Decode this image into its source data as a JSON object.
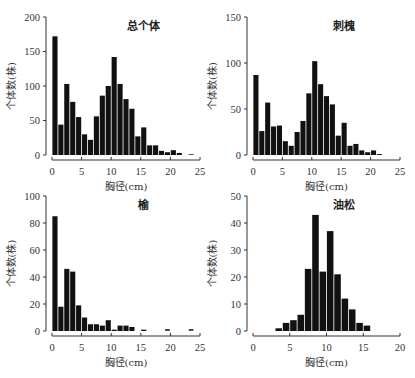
{
  "chart_data": [
    {
      "type": "bar",
      "title": "总个体",
      "xlabel": "胸径(cm)",
      "ylabel": "个体数(株)",
      "xlim": [
        0,
        25
      ],
      "ylim": [
        0,
        200
      ],
      "xticks": [
        0,
        5,
        10,
        15,
        20,
        25
      ],
      "yticks": [
        0,
        50,
        100,
        150,
        200
      ],
      "grid": false,
      "bin_width": 1,
      "x": [
        0.5,
        1.5,
        2.5,
        3.5,
        4.5,
        5.5,
        6.5,
        7.5,
        8.5,
        9.5,
        10.5,
        11.5,
        12.5,
        13.5,
        14.5,
        15.5,
        16.5,
        17.5,
        18.5,
        19.5,
        20.5,
        21.5,
        22.5,
        23.5
      ],
      "values": [
        172,
        44,
        103,
        77,
        55,
        30,
        22,
        56,
        86,
        100,
        142,
        103,
        81,
        67,
        27,
        40,
        14,
        14,
        6,
        4,
        7,
        3,
        0,
        1
      ]
    },
    {
      "type": "bar",
      "title": "刺槐",
      "xlabel": "胸径(cm)",
      "ylabel": "个体数(株)",
      "xlim": [
        0,
        25
      ],
      "ylim": [
        0,
        150
      ],
      "xticks": [
        0,
        5,
        10,
        15,
        20,
        25
      ],
      "yticks": [
        0,
        50,
        100,
        150
      ],
      "grid": false,
      "bin_width": 1,
      "x": [
        0.5,
        1.5,
        2.5,
        3.5,
        4.5,
        5.5,
        6.5,
        7.5,
        8.5,
        9.5,
        10.5,
        11.5,
        12.5,
        13.5,
        14.5,
        15.5,
        16.5,
        17.5,
        18.5,
        19.5,
        20.5,
        21.5
      ],
      "values": [
        87,
        26,
        57,
        31,
        32,
        15,
        10,
        25,
        37,
        67,
        102,
        77,
        64,
        55,
        21,
        35,
        10,
        12,
        5,
        3,
        5,
        1
      ]
    },
    {
      "type": "bar",
      "title": "榆",
      "xlabel": "胸径(cm)",
      "ylabel": "个体数(株)",
      "xlim": [
        0,
        25
      ],
      "ylim": [
        0,
        100
      ],
      "xticks": [
        0,
        5,
        10,
        15,
        20,
        25
      ],
      "yticks": [
        0,
        20,
        40,
        60,
        80,
        100
      ],
      "grid": false,
      "bin_width": 1,
      "x": [
        0.5,
        1.5,
        2.5,
        3.5,
        4.5,
        5.5,
        6.5,
        7.5,
        8.5,
        9.5,
        10.5,
        11.5,
        12.5,
        13.5,
        14.5,
        15.5,
        16.5,
        17.5,
        18.5,
        19.5,
        20.5,
        21.5,
        22.5,
        23.5
      ],
      "values": [
        85,
        18,
        46,
        44,
        19,
        10,
        5,
        5,
        4,
        8,
        1,
        4,
        4,
        3,
        0,
        1,
        0,
        0,
        0,
        0,
        0,
        0,
        0,
        0
      ],
      "markers_at_zero": [
        19.5,
        23.5
      ]
    },
    {
      "type": "bar",
      "title": "油松",
      "xlabel": "胸径(cm)",
      "ylabel": "个体数(株)",
      "xlim": [
        0,
        20
      ],
      "ylim": [
        0,
        50
      ],
      "xticks": [
        0,
        5,
        10,
        15,
        20
      ],
      "yticks": [
        0,
        10,
        20,
        30,
        40,
        50
      ],
      "grid": false,
      "bin_width": 1,
      "x": [
        3.5,
        4.5,
        5.5,
        6.5,
        7.5,
        8.5,
        9.5,
        10.5,
        11.5,
        12.5,
        13.5,
        14.5,
        15.5
      ],
      "values": [
        1,
        3,
        4,
        6,
        23,
        43,
        22,
        37,
        21,
        12,
        8,
        3,
        2
      ]
    }
  ],
  "panels": {
    "p0": {
      "title": "总个体",
      "xlabel": "胸径(cm)",
      "ylabel": "个体数(株)"
    },
    "p1": {
      "title": "刺槐",
      "xlabel": "胸径(cm)",
      "ylabel": "个体数(株)"
    },
    "p2": {
      "title": "榆",
      "xlabel": "胸径(cm)",
      "ylabel": "个体数(株)"
    },
    "p3": {
      "title": "油松",
      "xlabel": "胸径(cm)",
      "ylabel": "个体数(株)"
    }
  },
  "style": {
    "bar_color": "#111111",
    "bar_edge": "#ffffff",
    "axis_color": "#333333"
  }
}
